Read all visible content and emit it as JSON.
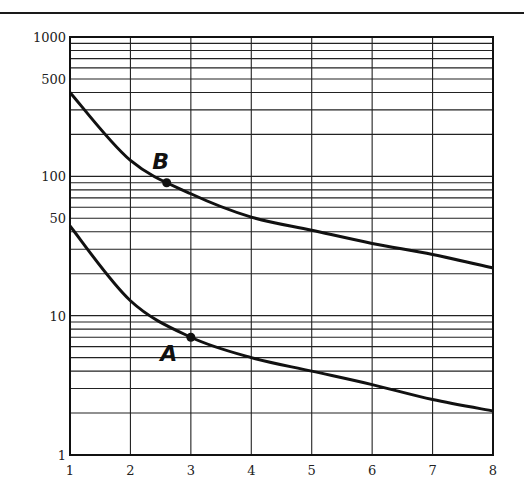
{
  "chart_data": {
    "type": "line",
    "title": "",
    "xlabel": "",
    "ylabel": "",
    "xscale": "linear",
    "yscale": "log",
    "xlim": [
      1,
      8
    ],
    "ylim": [
      1,
      1000
    ],
    "grid": true,
    "x_ticks": [
      "1",
      "2",
      "3",
      "4",
      "5",
      "6",
      "7",
      "8"
    ],
    "y_ticks": [
      "1",
      "10",
      "50",
      "100",
      "500",
      "1000"
    ],
    "x": [
      1,
      2,
      3,
      4,
      5,
      6,
      7,
      8
    ],
    "series": [
      {
        "name": "B",
        "values": [
          400,
          130,
          75,
          51,
          41,
          33,
          27.5,
          22
        ]
      },
      {
        "name": "A",
        "values": [
          44,
          12.8,
          7,
          5.0,
          4.0,
          3.2,
          2.5,
          2.07
        ]
      }
    ],
    "annotations": [
      {
        "label": "B",
        "x": 2.6,
        "y": 90
      },
      {
        "label": "A",
        "x": 3.0,
        "y": 7
      }
    ],
    "legend": "none"
  }
}
